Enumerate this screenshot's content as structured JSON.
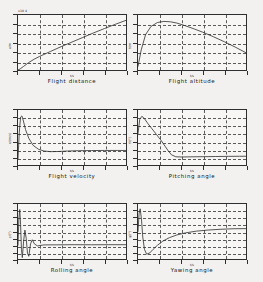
{
  "figure": {
    "background": "#f2f1ef",
    "line_color": "#333333",
    "grid_color": "#5a5a5a",
    "axis_color": "#2e2e2e"
  },
  "chart_data": [
    {
      "type": "line",
      "title": "Flight distance",
      "xlabel": "t/s",
      "ylabel": "x/m",
      "exponent": "x10 4",
      "grid": true,
      "legend": "none",
      "xlim": [
        0,
        500
      ],
      "ylim": [
        0,
        6
      ],
      "xticks": [
        "0",
        "100",
        "200",
        "300",
        "400",
        "500"
      ],
      "yticks": [
        "0",
        "1",
        "2",
        "3",
        "4",
        "5",
        "6"
      ],
      "x": [
        0,
        10,
        25,
        50,
        75,
        100,
        150,
        200,
        250,
        300,
        350,
        400,
        450,
        500
      ],
      "y": [
        0.0,
        0.12,
        0.38,
        0.82,
        1.18,
        1.48,
        2.02,
        2.55,
        3.05,
        3.55,
        4.05,
        4.52,
        4.98,
        5.42
      ]
    },
    {
      "type": "line",
      "title": "Flight altitude",
      "xlabel": "t/s",
      "ylabel": "h/m",
      "exponent": "",
      "grid": true,
      "legend": "none",
      "xlim": [
        0,
        500
      ],
      "ylim": [
        0,
        6000
      ],
      "xticks": [
        "0",
        "100",
        "200",
        "300",
        "400",
        "500"
      ],
      "yticks": [
        "0",
        "1000",
        "2000",
        "3000",
        "4000",
        "5000",
        "6000"
      ],
      "x": [
        0,
        15,
        35,
        60,
        90,
        120,
        150,
        180,
        220,
        260,
        300,
        350,
        400,
        450,
        500
      ],
      "y": [
        400,
        2200,
        3850,
        4750,
        5180,
        5300,
        5260,
        5120,
        4820,
        4480,
        4120,
        3620,
        3080,
        2500,
        1880
      ]
    },
    {
      "type": "line",
      "title": "Flight velocity",
      "xlabel": "t/s",
      "ylabel": "v/(m/s)",
      "exponent": "",
      "grid": true,
      "legend": "none",
      "xlim": [
        0,
        500
      ],
      "ylim": [
        0,
        700
      ],
      "xticks": [
        "0",
        "100",
        "200",
        "300",
        "400",
        "500"
      ],
      "yticks": [
        "0",
        "100",
        "200",
        "300",
        "400",
        "500",
        "600",
        "700"
      ],
      "x": [
        0,
        6,
        12,
        18,
        25,
        35,
        50,
        70,
        95,
        120,
        150,
        190,
        230,
        280,
        340,
        400,
        460,
        500
      ],
      "y": [
        80,
        420,
        610,
        625,
        560,
        450,
        340,
        250,
        200,
        178,
        170,
        172,
        178,
        182,
        184,
        185,
        185,
        185
      ]
    },
    {
      "type": "line",
      "title": "Pitching angle",
      "xlabel": "t/s",
      "ylabel": "θ/(°)",
      "exponent": "",
      "grid": true,
      "legend": "none",
      "xlim": [
        0,
        500
      ],
      "ylim": [
        -10,
        60
      ],
      "xticks": [
        "0",
        "100",
        "200",
        "300",
        "400",
        "500"
      ],
      "yticks": [
        "-10",
        "0",
        "10",
        "20",
        "30",
        "40",
        "50",
        "60"
      ],
      "x": [
        0,
        8,
        18,
        30,
        45,
        65,
        85,
        105,
        125,
        140,
        155,
        175,
        200,
        250,
        300,
        360,
        420,
        470,
        500
      ],
      "y": [
        30,
        48,
        52,
        49,
        43,
        36,
        29,
        22,
        14,
        8,
        3,
        0.5,
        0.2,
        0.4,
        0.6,
        0.8,
        1.0,
        1.1,
        1.1
      ]
    },
    {
      "type": "line",
      "title": "Rolling angle",
      "xlabel": "t/s",
      "ylabel": "γ/(°)",
      "exponent": "",
      "grid": true,
      "legend": "none",
      "xlim": [
        0,
        500
      ],
      "ylim": [
        -20,
        60
      ],
      "xticks": [
        "0",
        "100",
        "200",
        "300",
        "400",
        "500"
      ],
      "yticks": [
        "-20",
        "-10",
        "0",
        "10",
        "20",
        "30",
        "40",
        "50",
        "60"
      ],
      "x": [
        0,
        4,
        8,
        12,
        16,
        20,
        26,
        32,
        38,
        44,
        50,
        58,
        66,
        76,
        90,
        120,
        180,
        260,
        340,
        420,
        500
      ],
      "y": [
        0,
        38,
        52,
        30,
        -6,
        -18,
        6,
        22,
        10,
        -12,
        -16,
        2,
        8,
        2,
        -1,
        0.5,
        0.6,
        0.8,
        0.7,
        0.8,
        0.8
      ]
    },
    {
      "type": "line",
      "title": "Yawing angle",
      "xlabel": "t/s",
      "ylabel": "ψ/(°)",
      "exponent": "",
      "grid": true,
      "legend": "none",
      "xlim": [
        0,
        500
      ],
      "ylim": [
        -40,
        40
      ],
      "xticks": [
        "0",
        "100",
        "200",
        "300",
        "400",
        "500"
      ],
      "yticks": [
        "-40",
        "-30",
        "-20",
        "-10",
        "0",
        "10",
        "20",
        "30",
        "40"
      ],
      "x": [
        0,
        5,
        10,
        16,
        22,
        30,
        40,
        55,
        70,
        90,
        115,
        145,
        180,
        220,
        270,
        320,
        380,
        440,
        500
      ],
      "y": [
        0,
        26,
        33,
        18,
        -8,
        -26,
        -33,
        -31,
        -26,
        -20,
        -14,
        -9,
        -5,
        -2,
        0.5,
        2,
        3.2,
        4,
        4.2
      ]
    }
  ]
}
